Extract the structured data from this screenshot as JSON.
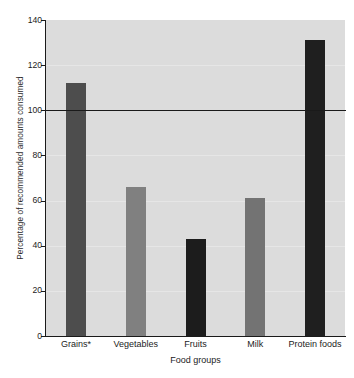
{
  "chart_data": {
    "type": "bar",
    "title": "",
    "categories": [
      "Grains*",
      "Vegetables",
      "Fruits",
      "Milk",
      "Protein foods"
    ],
    "values": [
      112,
      66,
      43,
      61,
      131
    ],
    "bar_colors": [
      "#4d4d4d",
      "#808080",
      "#1c1c1c",
      "#737373",
      "#1f1f1f"
    ],
    "xlabel": "Food groups",
    "ylabel": "Percentage of recommended amounts consumed",
    "ylim": [
      0,
      140
    ],
    "yticks": [
      0,
      20,
      40,
      60,
      80,
      100,
      120,
      140
    ],
    "ytick_labels": [
      "0",
      "20",
      "40",
      "60",
      "80",
      "100",
      "120",
      "140"
    ],
    "grid": true,
    "legend": "none",
    "annotations": [
      {
        "name": "reference-line",
        "type": "hline",
        "value": 100,
        "color": "#1a1a1a"
      }
    ],
    "plot_background": "#dcdcdc",
    "axis_color": "#1a1a1a"
  }
}
